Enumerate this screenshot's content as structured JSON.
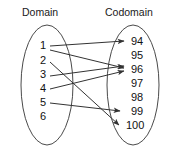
{
  "diagram": {
    "title_left": "Domain",
    "title_right": "Codomain",
    "domain_elements": [
      "1",
      "2",
      "3",
      "4",
      "5",
      "6"
    ],
    "codomain_elements": [
      "94",
      "95",
      "96",
      "97",
      "98",
      "99",
      "100"
    ],
    "mappings": [
      {
        "from": "1",
        "to": "94"
      },
      {
        "from": "1",
        "to": "96"
      },
      {
        "from": "2",
        "to": "100"
      },
      {
        "from": "3",
        "to": "96"
      },
      {
        "from": "4",
        "to": "96"
      },
      {
        "from": "5",
        "to": "99"
      }
    ],
    "unmapped_domain_elements": [
      "6"
    ],
    "unmapped_codomain_elements": [
      "95",
      "97",
      "98"
    ],
    "colors": {
      "line": "#333333",
      "ellipse": "#4a4a4a",
      "text": "#111111",
      "background": "#ffffff"
    }
  }
}
